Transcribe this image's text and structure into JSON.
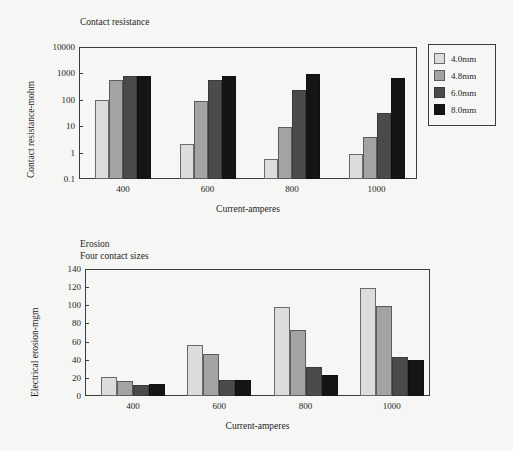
{
  "legend": {
    "entries": [
      {
        "label": "4.0mm",
        "color": "#dcdcdc"
      },
      {
        "label": "4.8mm",
        "color": "#a3a3a3"
      },
      {
        "label": "6.0mm",
        "color": "#4b4b4b"
      },
      {
        "label": "8.0mm",
        "color": "#151515"
      }
    ]
  },
  "chart_data": [
    {
      "type": "bar",
      "title": "Contact resistance",
      "xlabel": "Current-amperes",
      "ylabel": "Contact resistance-mohm",
      "categories": [
        "400",
        "600",
        "800",
        "1000"
      ],
      "yscale": "log",
      "ylim": [
        0.1,
        10000
      ],
      "yticks": [
        "10000",
        "1000",
        "100",
        "10",
        "1",
        "0.1"
      ],
      "ytick_values": [
        10000,
        1000,
        100,
        10,
        1,
        0.1
      ],
      "grid": false,
      "legend_position": "right-outside",
      "series": [
        {
          "name": "4.0mm",
          "values": [
            100,
            2.2,
            0.55,
            0.9
          ]
        },
        {
          "name": "4.8mm",
          "values": [
            550,
            88,
            9,
            4
          ]
        },
        {
          "name": "6.0mm",
          "values": [
            780,
            560,
            240,
            33
          ]
        },
        {
          "name": "8.0mm",
          "values": [
            790,
            800,
            920,
            680
          ]
        }
      ]
    },
    {
      "type": "bar",
      "title": "Erosion\nFour contact sizes",
      "title_line1": "Erosion",
      "title_line2": "Four contact sizes",
      "xlabel": "Current-amperes",
      "ylabel": "Electrical erosion-mgm",
      "categories": [
        "400",
        "600",
        "800",
        "1000"
      ],
      "yscale": "linear",
      "ylim": [
        0,
        140
      ],
      "yticks": [
        "140",
        "120",
        "100",
        "80",
        "60",
        "40",
        "20",
        "0"
      ],
      "ytick_values": [
        140,
        120,
        100,
        80,
        60,
        40,
        20,
        0
      ],
      "grid": false,
      "legend_position": "none",
      "series": [
        {
          "name": "4.0mm",
          "values": [
            21,
            56,
            98,
            119
          ]
        },
        {
          "name": "4.8mm",
          "values": [
            17,
            46.5,
            73,
            99
          ]
        },
        {
          "name": "6.0mm",
          "values": [
            12.5,
            18,
            31.5,
            43.5
          ]
        },
        {
          "name": "8.0mm",
          "values": [
            13,
            18,
            23,
            39.5
          ]
        }
      ]
    }
  ]
}
